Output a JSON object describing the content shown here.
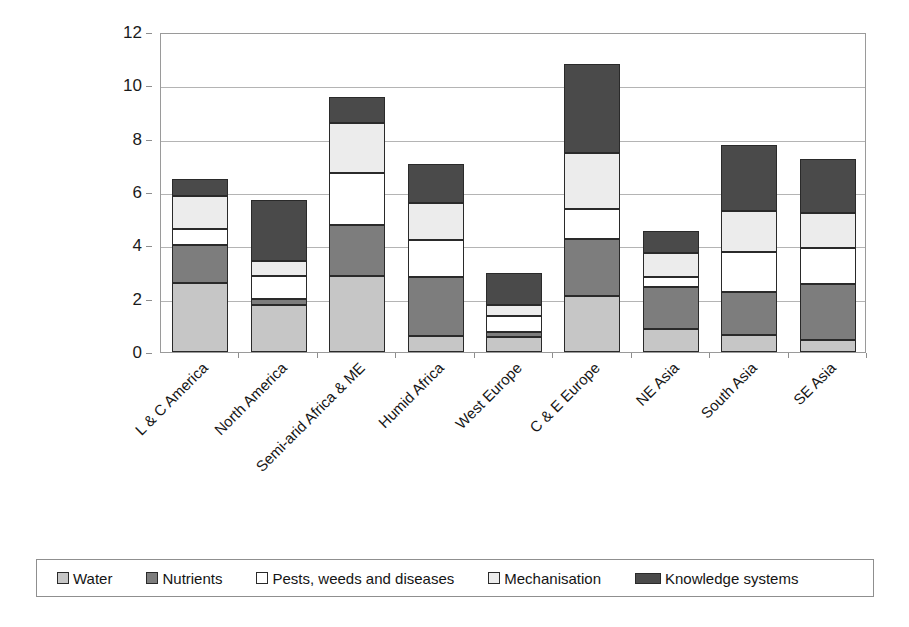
{
  "chart_data": {
    "type": "bar",
    "subtype": "stacked-bar",
    "title": "",
    "xlabel": "",
    "ylabel": "Yield gap (tonne/ha)",
    "ylim": [
      0,
      12
    ],
    "ytick_values": [
      0,
      2,
      4,
      6,
      8,
      10,
      12
    ],
    "ytick_labels": [
      "0",
      "2",
      "4",
      "6",
      "8",
      "10",
      "12"
    ],
    "grid": true,
    "legend_position": "bottom",
    "categories": [
      "L & C America",
      "North America",
      "Semi-arid Africa & ME",
      "Humid Africa",
      "West Europe",
      "C & E Europe",
      "NE Asia",
      "South Asia",
      "SE Asia"
    ],
    "series": [
      {
        "name": "Water",
        "color": "#c6c6c6",
        "values": [
          2.6,
          1.75,
          2.85,
          0.6,
          0.55,
          2.1,
          0.85,
          0.65,
          0.45
        ]
      },
      {
        "name": "Nutrients",
        "color": "#7d7d7d",
        "values": [
          1.4,
          0.25,
          1.9,
          2.2,
          0.2,
          2.15,
          1.6,
          1.6,
          2.1
        ]
      },
      {
        "name": "Pests, weeds and diseases",
        "color": "#ffffff",
        "values": [
          0.6,
          0.85,
          1.95,
          1.4,
          0.6,
          1.1,
          0.35,
          1.5,
          1.35
        ]
      },
      {
        "name": "Mechanisation",
        "color": "#ececec",
        "values": [
          1.25,
          0.55,
          1.9,
          1.4,
          0.4,
          2.1,
          0.9,
          1.55,
          1.3
        ]
      },
      {
        "name": "Knowledge systems",
        "color": "#4a4a4a",
        "values": [
          0.65,
          2.3,
          0.95,
          1.45,
          1.2,
          3.35,
          0.85,
          2.45,
          2.05
        ]
      }
    ],
    "totals": [
      6.5,
      5.7,
      9.55,
      7.05,
      2.95,
      10.8,
      4.55,
      7.75,
      7.25
    ]
  },
  "legend": {
    "items": [
      {
        "label": "Water",
        "color": "#c6c6c6",
        "style": "square"
      },
      {
        "label": "Nutrients",
        "color": "#7d7d7d",
        "style": "square"
      },
      {
        "label": "Pests, weeds and diseases",
        "color": "#ffffff",
        "style": "square"
      },
      {
        "label": "Mechanisation",
        "color": "#ececec",
        "style": "square"
      },
      {
        "label": "Knowledge systems",
        "color": "#4a4a4a",
        "style": "wide"
      }
    ]
  },
  "axes": {
    "y_title": "Yield gap (tonne/ha)"
  }
}
